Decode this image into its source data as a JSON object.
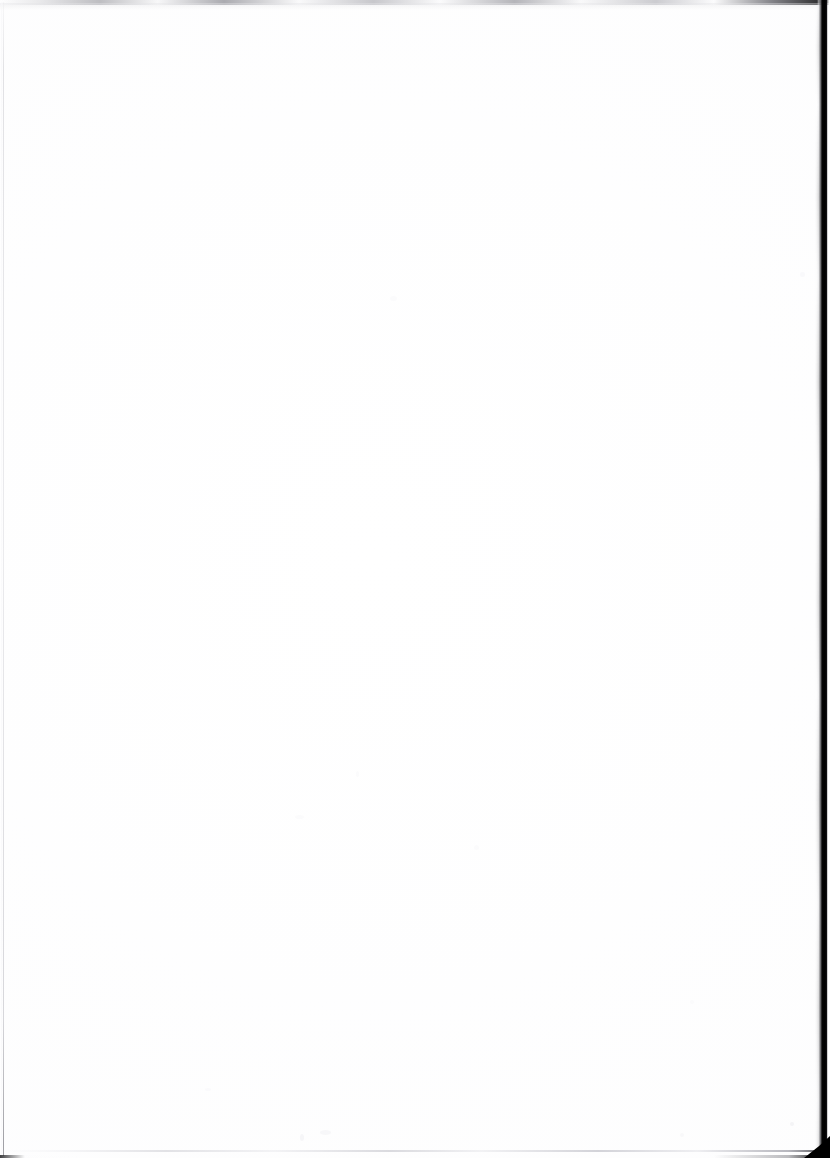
{
  "page": {
    "kind": "scanned-document-page",
    "content_state": "blank",
    "body_text": "",
    "width_px": 830,
    "height_px": 1158
  },
  "colors": {
    "paper": "#ffffff",
    "paper_tone": "#fcfcfd",
    "scan_shadow": "#000000",
    "edge_line_gray": "#d6d6da",
    "speck_gray": "#fbfbfc"
  },
  "artifacts": [
    {
      "name": "right-scan-shadow",
      "edge": "right",
      "color": "#000000"
    },
    {
      "name": "bottom-right-corner-wedge",
      "edge": "bottom-right",
      "color": "#000000"
    },
    {
      "name": "top-edge-band",
      "edge": "top",
      "color": "#a8a8ad"
    },
    {
      "name": "left-edge-line",
      "edge": "left",
      "color": "#d8d8dc"
    },
    {
      "name": "bottom-edge-line",
      "edge": "bottom",
      "color": "#ced2d8"
    }
  ]
}
